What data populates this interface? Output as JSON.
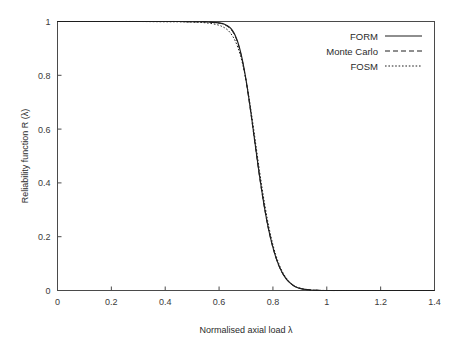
{
  "chart_data": {
    "type": "line",
    "title": "",
    "xlabel": "Normalised axial load λ",
    "ylabel": "Reliability function R (λ)",
    "xlim": [
      0,
      1.4
    ],
    "ylim": [
      0,
      1
    ],
    "grid": false,
    "legend_position": "top-right",
    "xticks": [
      "0",
      "0.2",
      "0.4",
      "0.6",
      "0.8",
      "1",
      "1.2",
      "1.4"
    ],
    "xtick_values": [
      0,
      0.2,
      0.4,
      0.6,
      0.8,
      1,
      1.2,
      1.4
    ],
    "yticks": [
      "0",
      "0.2",
      "0.4",
      "0.6",
      "0.8",
      "1"
    ],
    "ytick_values": [
      0,
      0.2,
      0.4,
      0.6,
      0.8,
      1
    ],
    "x": [
      0.0,
      0.1,
      0.2,
      0.3,
      0.4,
      0.45,
      0.5,
      0.52,
      0.54,
      0.56,
      0.58,
      0.6,
      0.61,
      0.62,
      0.63,
      0.64,
      0.65,
      0.66,
      0.67,
      0.68,
      0.69,
      0.7,
      0.71,
      0.72,
      0.73,
      0.74,
      0.75,
      0.76,
      0.77,
      0.78,
      0.79,
      0.8,
      0.81,
      0.82,
      0.83,
      0.84,
      0.85,
      0.86,
      0.87,
      0.88,
      0.89,
      0.9,
      0.92,
      0.94,
      0.96,
      1.0,
      1.1,
      1.2,
      1.3,
      1.4
    ],
    "series": [
      {
        "name": "FORM",
        "style": "solid",
        "color": "#1e1e1e",
        "values": [
          1.0,
          1.0,
          1.0,
          1.0,
          1.0,
          1.0,
          0.999,
          0.999,
          0.999,
          0.998,
          0.997,
          0.995,
          0.993,
          0.99,
          0.985,
          0.978,
          0.966,
          0.948,
          0.922,
          0.886,
          0.84,
          0.784,
          0.719,
          0.648,
          0.574,
          0.5,
          0.428,
          0.362,
          0.301,
          0.247,
          0.2,
          0.16,
          0.126,
          0.098,
          0.075,
          0.057,
          0.042,
          0.031,
          0.023,
          0.016,
          0.011,
          0.008,
          0.004,
          0.002,
          0.001,
          0.0,
          0.0,
          0.0,
          0.0,
          0.0
        ]
      },
      {
        "name": "Monte Carlo",
        "style": "dashed",
        "color": "#1e1e1e",
        "values": [
          1.0,
          1.0,
          1.0,
          1.0,
          1.0,
          1.0,
          0.999,
          0.999,
          0.999,
          0.998,
          0.996,
          0.994,
          0.992,
          0.988,
          0.983,
          0.975,
          0.963,
          0.945,
          0.919,
          0.883,
          0.837,
          0.781,
          0.716,
          0.645,
          0.571,
          0.497,
          0.425,
          0.359,
          0.299,
          0.245,
          0.199,
          0.159,
          0.125,
          0.097,
          0.074,
          0.056,
          0.042,
          0.031,
          0.022,
          0.016,
          0.011,
          0.008,
          0.004,
          0.002,
          0.001,
          0.0,
          0.0,
          0.0,
          0.0,
          0.0
        ]
      },
      {
        "name": "FOSM",
        "style": "dotted",
        "color": "#1e1e1e",
        "values": [
          1.0,
          1.0,
          1.0,
          1.0,
          0.999,
          0.999,
          0.998,
          0.997,
          0.996,
          0.994,
          0.991,
          0.986,
          0.982,
          0.977,
          0.97,
          0.96,
          0.946,
          0.928,
          0.903,
          0.871,
          0.831,
          0.782,
          0.724,
          0.659,
          0.589,
          0.517,
          0.446,
          0.379,
          0.317,
          0.261,
          0.212,
          0.17,
          0.134,
          0.105,
          0.08,
          0.061,
          0.046,
          0.034,
          0.024,
          0.017,
          0.012,
          0.009,
          0.004,
          0.002,
          0.001,
          0.0,
          0.0,
          0.0,
          0.0,
          0.0
        ]
      }
    ]
  },
  "axes": {
    "x_title": "Normalised axial load λ",
    "y_title": "Reliability function R (λ)"
  },
  "legend": {
    "entries": [
      {
        "label": "FORM",
        "style": "solid"
      },
      {
        "label": "Monte Carlo",
        "style": "dashed"
      },
      {
        "label": "FOSM",
        "style": "dotted"
      }
    ]
  },
  "ticks": {
    "x": [
      "0",
      "0.2",
      "0.4",
      "0.6",
      "0.8",
      "1",
      "1.2",
      "1.4"
    ],
    "y": [
      "0",
      "0.2",
      "0.4",
      "0.6",
      "0.8",
      "1"
    ]
  },
  "colors": {
    "background": "#ffffff",
    "frame": "#4a4a4a",
    "line": "#1e1e1e",
    "text": "#2b2b2b"
  }
}
